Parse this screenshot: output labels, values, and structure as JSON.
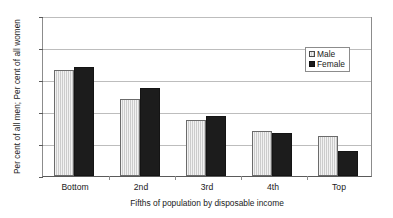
{
  "chart_data": {
    "type": "bar",
    "title": "",
    "categories": [
      "Bottom",
      "2nd",
      "3rd",
      "4th",
      "Top"
    ],
    "series": [
      {
        "name": "Male",
        "values": [
          33.0,
          24.0,
          17.6,
          14.0,
          12.6
        ]
      },
      {
        "name": "Female",
        "values": [
          34.0,
          27.6,
          18.8,
          13.3,
          7.8
        ]
      }
    ],
    "xlabel": "Fifths of population by disposable income",
    "ylabel": "Per cent of all men; Per cent of all women",
    "ylim": [
      0,
      50
    ],
    "yticks": [
      0,
      10,
      20,
      30,
      40,
      50
    ],
    "ytick_labels": [
      "0",
      "10",
      "20",
      "30",
      "40",
      "50"
    ],
    "grid": "horizontal",
    "legend_position": "top-right",
    "colors": {
      "male": "#cccccc",
      "female": "#1c1c1c",
      "gridline": "#bdbdbd",
      "axis": "#5a5a5a",
      "background": "#ffffff",
      "text": "#1a1a1a"
    }
  }
}
